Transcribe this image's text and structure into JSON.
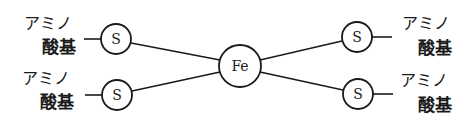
{
  "diagram": {
    "center": {
      "id": "fe",
      "label": "Fe",
      "cx": 240,
      "cy": 66,
      "r": 21
    },
    "ligands": [
      {
        "id": "s-top-left",
        "label": "S",
        "cx": 116,
        "cy": 39,
        "r": 15,
        "group_line1": "アミノ",
        "group_line2": "酸基",
        "side": "left"
      },
      {
        "id": "s-bottom-left",
        "label": "S",
        "cx": 117,
        "cy": 95,
        "r": 15,
        "group_line1": "アミノ",
        "group_line2": "酸基",
        "side": "left"
      },
      {
        "id": "s-top-right",
        "label": "S",
        "cx": 357,
        "cy": 37,
        "r": 15,
        "group_line1": "アミノ",
        "group_line2": "酸基",
        "side": "right"
      },
      {
        "id": "s-bottom-right",
        "label": "S",
        "cx": 358,
        "cy": 94,
        "r": 15,
        "group_line1": "アミノ",
        "group_line2": "酸基",
        "side": "right"
      }
    ],
    "line_color": "#1a1a1a"
  }
}
